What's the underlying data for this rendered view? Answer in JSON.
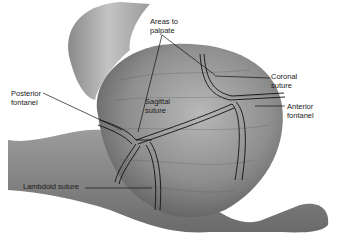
{
  "figure": {
    "labels": {
      "areas_to_palpate": "Areas to\npalpate",
      "coronal_suture": "Coronal\nsuture",
      "posterior_fontanel": "Posterior\nfontanel",
      "sagittal_suture": "Sagittal\nsuture",
      "anterior_fontanel": "Anterior\nfontanel",
      "lambdoid_suture": "Lambdoid suture"
    }
  },
  "colors": {
    "background": "#ffffff",
    "skin_dark": "#6f6f6f",
    "skin_mid": "#9a9a9a",
    "skin_light": "#c9c9c9",
    "line": "#111111"
  }
}
